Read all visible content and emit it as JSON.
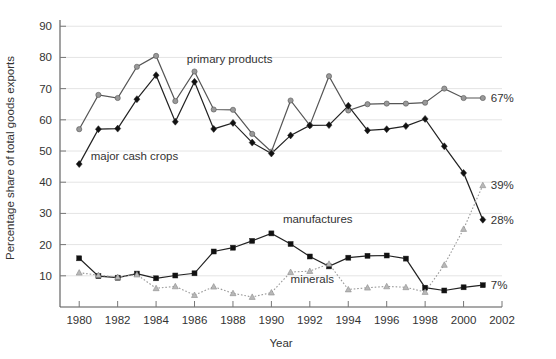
{
  "chart_data": {
    "type": "line",
    "title": "",
    "xlabel": "Year",
    "ylabel": "Percentage share of total goods exports",
    "xlim": [
      1979,
      2002
    ],
    "ylim": [
      0,
      92
    ],
    "xticks": [
      1980,
      1982,
      1984,
      1986,
      1988,
      1990,
      1992,
      1994,
      1996,
      1998,
      2000,
      2002
    ],
    "xtick_labels": [
      "1980",
      "1982",
      "1984",
      "1986",
      "1988",
      "1990",
      "1992",
      "1994",
      "1996",
      "1998",
      "2000",
      "2002"
    ],
    "yticks": [
      10,
      20,
      30,
      40,
      50,
      60,
      70,
      80,
      90
    ],
    "ytick_labels": [
      "10",
      "20",
      "30",
      "40",
      "50",
      "60",
      "70",
      "80",
      "90"
    ],
    "grid": true,
    "legend_position": "inline-annotations",
    "x": [
      1980,
      1981,
      1982,
      1983,
      1984,
      1985,
      1986,
      1987,
      1988,
      1989,
      1990,
      1991,
      1992,
      1993,
      1994,
      1995,
      1996,
      1997,
      1998,
      1999,
      2000,
      2001
    ],
    "series": [
      {
        "name": "primary products",
        "color": "#555555",
        "marker": "circle",
        "marker_fill": "#999999",
        "line_style": "solid",
        "label": "primary products",
        "label_x": 1985.6,
        "label_y": 77.0,
        "end_label": "67%",
        "values": [
          57.0,
          68.0,
          67.0,
          77.0,
          80.5,
          66.0,
          75.5,
          63.3,
          63.2,
          55.5,
          49.8,
          66.2,
          58.2,
          74.0,
          63.0,
          65.0,
          65.2,
          65.2,
          65.5,
          70.0,
          67.0,
          67.0
        ]
      },
      {
        "name": "major cash crops",
        "color": "#222222",
        "marker": "diamond",
        "marker_fill": "#111111",
        "line_style": "solid",
        "label": "major cash crops",
        "label_x": 1980.6,
        "label_y": 45.8,
        "end_label": "28%",
        "values": [
          45.8,
          57.0,
          57.2,
          66.6,
          74.3,
          59.4,
          72.2,
          57.1,
          59.0,
          52.7,
          49.2,
          55.0,
          58.2,
          58.3,
          64.5,
          56.6,
          57.0,
          58.0,
          60.3,
          51.5,
          43.0,
          28.0
        ]
      },
      {
        "name": "manufactures",
        "color": "#222222",
        "marker": "square",
        "marker_fill": "#111111",
        "line_style": "solid",
        "label": "manufactures",
        "label_x": 1990.6,
        "label_y": 25.6,
        "end_label": "7%",
        "values": [
          15.6,
          9.9,
          9.4,
          10.7,
          9.2,
          10.1,
          10.8,
          17.8,
          19.0,
          21.2,
          23.6,
          20.2,
          16.2,
          13.0,
          15.8,
          16.4,
          16.5,
          15.5,
          6.2,
          5.3,
          6.3,
          7.0
        ]
      },
      {
        "name": "minerals",
        "color": "#9a9a9a",
        "marker": "triangle",
        "marker_fill": "#b8b8b8",
        "line_style": "dotted",
        "label": "minerals",
        "label_x": 1991.0,
        "label_y": 6.4,
        "end_label": "39%",
        "values": [
          11.0,
          10.2,
          9.6,
          10.4,
          6.0,
          6.6,
          3.8,
          6.5,
          4.4,
          3.2,
          4.6,
          11.2,
          11.5,
          13.8,
          5.6,
          6.2,
          6.6,
          6.3,
          4.8,
          13.5,
          25.0,
          39.0
        ]
      }
    ]
  },
  "axis": {
    "x_title": "Year",
    "y_title": "Percentage share of total goods exports"
  }
}
